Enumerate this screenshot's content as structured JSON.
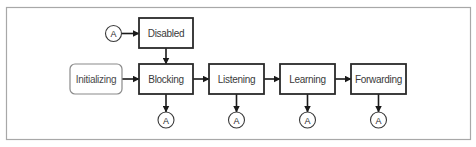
{
  "diagram": {
    "frame": {
      "x": 6.5,
      "y": 7.5,
      "w": 464,
      "h": 132
    },
    "colors": {
      "frame_border": "#a8a8a8",
      "state_border": "#2a2a2a",
      "start_border": "#8a8a8a",
      "text": "#3a3a3a",
      "arrow": "#1a1a1a"
    },
    "nodes": [
      {
        "id": "initializing",
        "label": "Initializing",
        "type": "start",
        "x": 70,
        "y": 64,
        "w": 52,
        "h": 30
      },
      {
        "id": "disabled",
        "label": "Disabled",
        "type": "state",
        "x": 139,
        "y": 18,
        "w": 54,
        "h": 30
      },
      {
        "id": "blocking",
        "label": "Blocking",
        "type": "state",
        "x": 139,
        "y": 64,
        "w": 54,
        "h": 30
      },
      {
        "id": "listening",
        "label": "Listening",
        "type": "state",
        "x": 209,
        "y": 64,
        "w": 55,
        "h": 30
      },
      {
        "id": "learning",
        "label": "Learning",
        "type": "state",
        "x": 280,
        "y": 64,
        "w": 55,
        "h": 30
      },
      {
        "id": "forwarding",
        "label": "Forwarding",
        "type": "state",
        "x": 351,
        "y": 64,
        "w": 55,
        "h": 30
      }
    ],
    "connectors": [
      {
        "id": "connector-a-disabled",
        "label": "A",
        "cx": 113.5,
        "cy": 33.5,
        "r": 8
      },
      {
        "id": "connector-a-blocking",
        "label": "A",
        "cx": 166,
        "cy": 120,
        "r": 8
      },
      {
        "id": "connector-a-listening",
        "label": "A",
        "cx": 236.5,
        "cy": 120,
        "r": 8
      },
      {
        "id": "connector-a-learning",
        "label": "A",
        "cx": 307.5,
        "cy": 120,
        "r": 8
      },
      {
        "id": "connector-a-forwarding",
        "label": "A",
        "cx": 378.5,
        "cy": 120,
        "r": 8
      }
    ],
    "edges": [
      {
        "from": "connector-a-disabled",
        "to": "disabled",
        "x1": 121.5,
        "y1": 33.5,
        "x2": 139,
        "y2": 33.5
      },
      {
        "from": "disabled",
        "to": "blocking",
        "x1": 166,
        "y1": 48,
        "x2": 166,
        "y2": 64
      },
      {
        "from": "initializing",
        "to": "blocking",
        "x1": 122,
        "y1": 79,
        "x2": 139,
        "y2": 79
      },
      {
        "from": "blocking",
        "to": "listening",
        "x1": 193,
        "y1": 79,
        "x2": 209,
        "y2": 79
      },
      {
        "from": "listening",
        "to": "learning",
        "x1": 264,
        "y1": 79,
        "x2": 280,
        "y2": 79
      },
      {
        "from": "learning",
        "to": "forwarding",
        "x1": 335,
        "y1": 79,
        "x2": 351,
        "y2": 79
      },
      {
        "from": "blocking",
        "to": "connector-a-blocking",
        "x1": 166,
        "y1": 94,
        "x2": 166,
        "y2": 112
      },
      {
        "from": "listening",
        "to": "connector-a-listening",
        "x1": 236.5,
        "y1": 94,
        "x2": 236.5,
        "y2": 112
      },
      {
        "from": "learning",
        "to": "connector-a-learning",
        "x1": 307.5,
        "y1": 94,
        "x2": 307.5,
        "y2": 112
      },
      {
        "from": "forwarding",
        "to": "connector-a-forwarding",
        "x1": 378.5,
        "y1": 94,
        "x2": 378.5,
        "y2": 112
      }
    ]
  }
}
